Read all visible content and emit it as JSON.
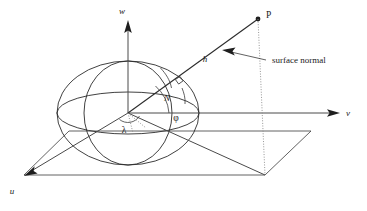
{
  "figure": {
    "kind": "geodetic-ellipsoid-diagram",
    "background_color": "#ffffff",
    "line_color": "#2b2b2b",
    "dotted_color": "#8a8a8a"
  },
  "axes": {
    "u_label": "u",
    "v_label": "v",
    "w_label": "w"
  },
  "points": {
    "p_label": "P"
  },
  "labels": {
    "height_label": "h",
    "prime_vertical_label": "N",
    "latitude_label": "φ",
    "longitude_label": "λ",
    "surface_normal_label": "surface normal"
  },
  "icons": {
    "axis_arrow": "arrowhead-icon",
    "pointer_arrow": "annotation-arrow-icon",
    "right_angle": "right-angle-marker-icon",
    "point_dot": "point-marker-icon"
  }
}
